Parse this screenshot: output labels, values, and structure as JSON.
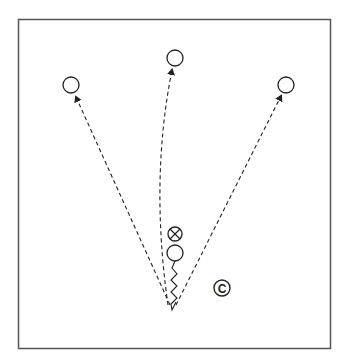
{
  "diagram": {
    "type": "sports-drill",
    "frame": {
      "x": 18,
      "y": 19,
      "width": 313,
      "height": 329,
      "stroke": "#555555"
    },
    "colors": {
      "stroke": "#222222",
      "background": "#ffffff"
    },
    "players": [
      {
        "id": "receiver-left",
        "symbol": "circle",
        "cx": 71,
        "cy": 85
      },
      {
        "id": "receiver-center",
        "symbol": "circle",
        "cx": 175,
        "cy": 58
      },
      {
        "id": "receiver-right",
        "symbol": "circle",
        "cx": 286,
        "cy": 85
      },
      {
        "id": "defender",
        "symbol": "circled-x",
        "cx": 175,
        "cy": 234
      },
      {
        "id": "ball-carrier",
        "symbol": "circle",
        "cx": 175,
        "cy": 253
      }
    ],
    "coach": {
      "label": "C",
      "cx": 222,
      "cy": 288
    },
    "origin": {
      "x": 172,
      "y": 310
    },
    "passes": [
      {
        "to": "receiver-left",
        "style": "dashed-arrow"
      },
      {
        "to": "receiver-center",
        "style": "dashed-curved-arrow"
      },
      {
        "to": "receiver-right",
        "style": "dashed-arrow"
      }
    ],
    "dribble": {
      "from": "ball-carrier",
      "to": "origin",
      "style": "zigzag"
    }
  }
}
